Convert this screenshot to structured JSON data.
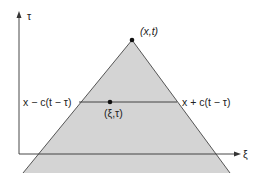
{
  "diagram": {
    "axes": {
      "vertical_label": "τ",
      "horizontal_label": "ξ"
    },
    "apex": {
      "label": "(x,t)"
    },
    "point": {
      "label": "(ξ,τ)"
    },
    "segment": {
      "left_label": "x − c(t − τ)",
      "right_label": "x + c(t − τ)"
    },
    "colors": {
      "fill": "#d4d4d4",
      "line": "#333333"
    }
  }
}
